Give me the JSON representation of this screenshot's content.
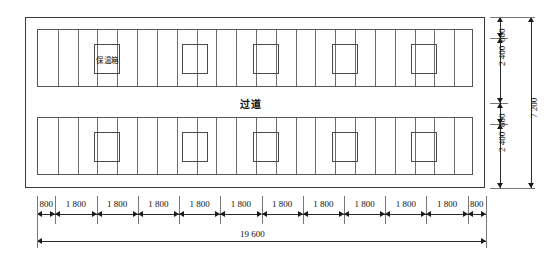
{
  "drawing": {
    "type": "architectural-floor-plan",
    "units": "mm",
    "labels": {
      "storage_box": "保温箱",
      "aisle": "过道"
    },
    "overall": {
      "width_label": "19 600",
      "height_label": "7 200"
    },
    "horizontal_dimensions": {
      "segments": [
        "800",
        "1 800",
        "1 800",
        "1 800",
        "1 800",
        "1 800",
        "1 800",
        "1 800",
        "1 800",
        "1 800",
        "1 800",
        "800"
      ],
      "total": "19 600"
    },
    "vertical_dimensions": {
      "segments": [
        "800",
        "2 400",
        "800",
        "2 400"
      ],
      "total": "7 200"
    },
    "bands": [
      {
        "name": "upper-band",
        "depth_label": "2 400",
        "cell_count": 22,
        "boxes": [
          {
            "index": 0,
            "label": "保温箱"
          },
          {
            "index": 1,
            "label": ""
          },
          {
            "index": 2,
            "label": ""
          },
          {
            "index": 3,
            "label": ""
          },
          {
            "index": 4,
            "label": ""
          }
        ]
      },
      {
        "name": "lower-band",
        "depth_label": "2 400",
        "cell_count": 22,
        "boxes": [
          {
            "index": 0,
            "label": ""
          },
          {
            "index": 1,
            "label": ""
          },
          {
            "index": 2,
            "label": ""
          },
          {
            "index": 3,
            "label": ""
          },
          {
            "index": 4,
            "label": ""
          }
        ]
      }
    ],
    "colors": {
      "line": "#3a3a3a",
      "thin_line": "#6d6d6d",
      "text": "#111111",
      "background": "#ffffff"
    }
  }
}
